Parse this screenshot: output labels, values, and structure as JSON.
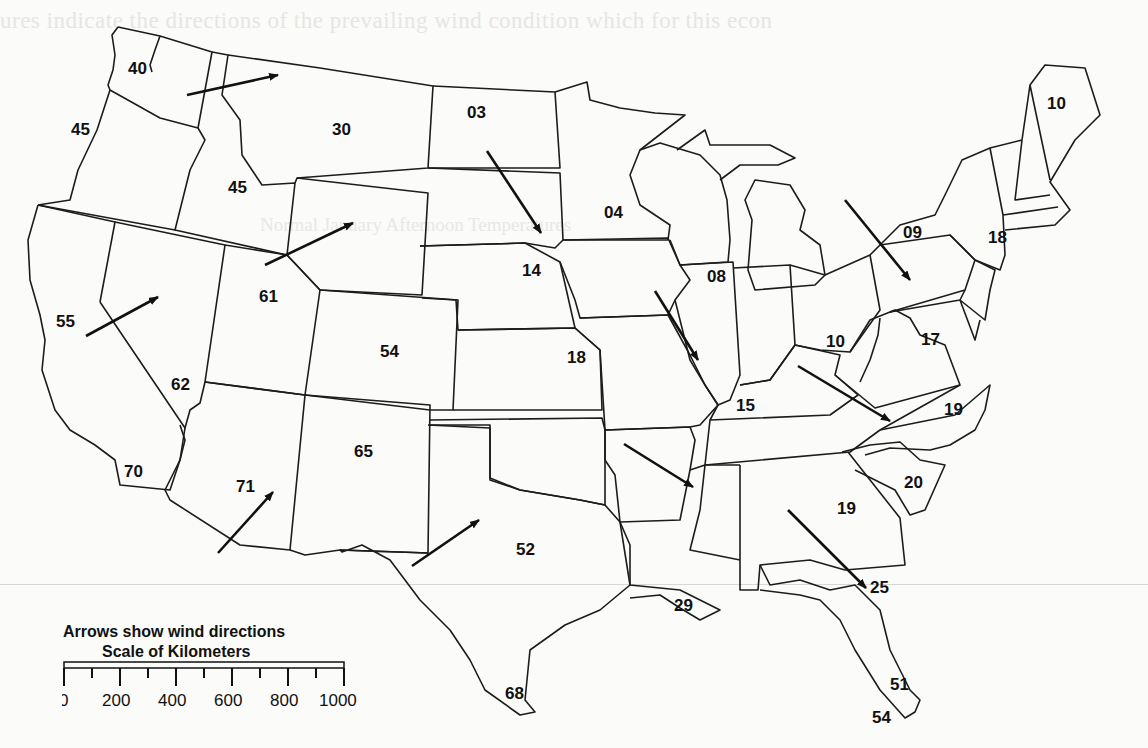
{
  "page": {
    "ghost_text_top": "ures indicate the directions of the prevailing wind condition which for this econ",
    "ghost_text_second": "Normal January Afternoon Temperatures"
  },
  "legend": {
    "arrows_caption": "Arrows show wind directions",
    "scale_caption": "Scale of Kilometers",
    "scale_ticks": [
      "0",
      "200",
      "400",
      "600",
      "800",
      "1000"
    ]
  },
  "map": {
    "title": "Normal January Afternoon Temperatures",
    "labels": [
      {
        "id": "wa",
        "text": "40",
        "x": 128,
        "y": 74
      },
      {
        "id": "or",
        "text": "45",
        "x": 71,
        "y": 135
      },
      {
        "id": "mt",
        "text": "30",
        "x": 332,
        "y": 135
      },
      {
        "id": "id",
        "text": "45",
        "x": 228,
        "y": 193
      },
      {
        "id": "nd",
        "text": "03",
        "x": 467,
        "y": 118
      },
      {
        "id": "mn",
        "text": "04",
        "x": 604,
        "y": 218
      },
      {
        "id": "me",
        "text": "10",
        "x": 1047,
        "y": 109
      },
      {
        "id": "ny",
        "text": "09",
        "x": 903,
        "y": 238
      },
      {
        "id": "ct",
        "text": "18",
        "x": 988,
        "y": 243
      },
      {
        "id": "ne",
        "text": "14",
        "x": 522,
        "y": 276
      },
      {
        "id": "il",
        "text": "08",
        "x": 707,
        "y": 282
      },
      {
        "id": "ut",
        "text": "61",
        "x": 259,
        "y": 302
      },
      {
        "id": "ca-n",
        "text": "55",
        "x": 56,
        "y": 327
      },
      {
        "id": "oh",
        "text": "10",
        "x": 826,
        "y": 347
      },
      {
        "id": "co",
        "text": "54",
        "x": 380,
        "y": 357
      },
      {
        "id": "ks",
        "text": "18",
        "x": 567,
        "y": 363
      },
      {
        "id": "va",
        "text": "17",
        "x": 921,
        "y": 345
      },
      {
        "id": "nv",
        "text": "62",
        "x": 171,
        "y": 390
      },
      {
        "id": "ky",
        "text": "15",
        "x": 736,
        "y": 411
      },
      {
        "id": "nc",
        "text": "19",
        "x": 944,
        "y": 415
      },
      {
        "id": "nm",
        "text": "65",
        "x": 354,
        "y": 457
      },
      {
        "id": "ca-s",
        "text": "70",
        "x": 124,
        "y": 477
      },
      {
        "id": "az",
        "text": "71",
        "x": 236,
        "y": 492
      },
      {
        "id": "sc",
        "text": "20",
        "x": 904,
        "y": 488
      },
      {
        "id": "ga",
        "text": "19",
        "x": 837,
        "y": 514
      },
      {
        "id": "tx",
        "text": "52",
        "x": 516,
        "y": 555
      },
      {
        "id": "fl-n",
        "text": "25",
        "x": 870,
        "y": 593
      },
      {
        "id": "la",
        "text": "29",
        "x": 674,
        "y": 611
      },
      {
        "id": "tx-s",
        "text": "68",
        "x": 505,
        "y": 699
      },
      {
        "id": "fl-s",
        "text": "51",
        "x": 890,
        "y": 690
      },
      {
        "id": "fl-k",
        "text": "54",
        "x": 872,
        "y": 723
      }
    ],
    "arrows": [
      {
        "region": "wa-mt",
        "x1": 187,
        "y1": 95,
        "x2": 278,
        "y2": 75,
        "direction": "east"
      },
      {
        "region": "nd-sd",
        "x1": 487,
        "y1": 151,
        "x2": 541,
        "y2": 233,
        "direction": "southeast"
      },
      {
        "region": "ny-pa",
        "x1": 845,
        "y1": 200,
        "x2": 910,
        "y2": 280,
        "direction": "southeast"
      },
      {
        "region": "ut-wy",
        "x1": 265,
        "y1": 265,
        "x2": 353,
        "y2": 223,
        "direction": "northeast"
      },
      {
        "region": "ca-nv",
        "x1": 86,
        "y1": 336,
        "x2": 158,
        "y2": 297,
        "direction": "northeast"
      },
      {
        "region": "ia-il",
        "x1": 655,
        "y1": 291,
        "x2": 698,
        "y2": 360,
        "direction": "southeast"
      },
      {
        "region": "ky-nc",
        "x1": 798,
        "y1": 366,
        "x2": 890,
        "y2": 421,
        "direction": "southeast"
      },
      {
        "region": "ar-ms",
        "x1": 624,
        "y1": 444,
        "x2": 693,
        "y2": 487,
        "direction": "southeast"
      },
      {
        "region": "az",
        "x1": 218,
        "y1": 553,
        "x2": 273,
        "y2": 492,
        "direction": "northeast"
      },
      {
        "region": "tx",
        "x1": 412,
        "y1": 566,
        "x2": 479,
        "y2": 520,
        "direction": "northeast"
      },
      {
        "region": "al-fl",
        "x1": 788,
        "y1": 510,
        "x2": 866,
        "y2": 588,
        "direction": "southeast"
      }
    ]
  }
}
